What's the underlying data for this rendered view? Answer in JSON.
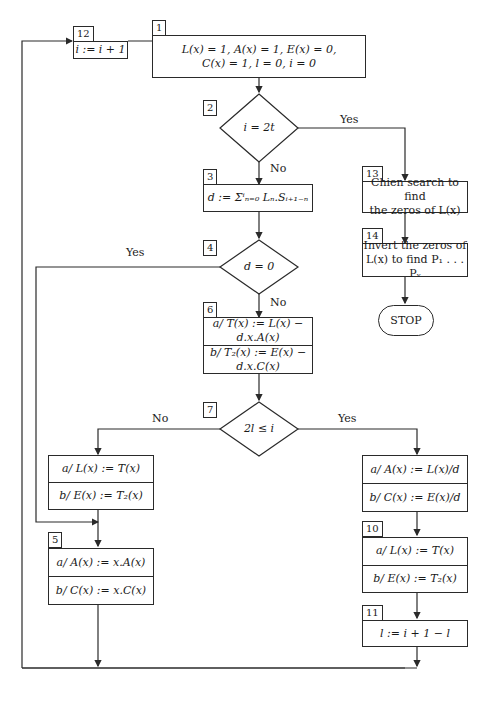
{
  "flowchart": {
    "nodes": {
      "n1": {
        "id": "1",
        "lines": [
          "L(x) = 1,  A(x) = 1,  E(x) = 0,",
          "C(x) = 1,  l = 0,  i = 0"
        ]
      },
      "n2": {
        "id": "2",
        "condition": "i = 2t"
      },
      "n3": {
        "id": "3",
        "text": "d := Σⁱₙ₌₀ Lₙ.Sᵢ₊₁₋ₙ"
      },
      "n4": {
        "id": "4",
        "condition": "d = 0"
      },
      "n5": {
        "id": "5",
        "a": "a/ A(x) := x.A(x)",
        "b": "b/ C(x) := x.C(x)"
      },
      "n6": {
        "id": "6",
        "a": "a/ T(x) := L(x) − d.x.A(x)",
        "b": "b/ T₂(x) := E(x) − d.x.C(x)"
      },
      "n7": {
        "id": "7",
        "condition": "2l ≤ i"
      },
      "n8": {
        "id": "8",
        "a": "a/ L(x) := T(x)",
        "b": "b/ E(x) := T₂(x)"
      },
      "n9": {
        "id": "9",
        "a": "a/ A(x) := L(x)/d",
        "b": "b/ C(x) := E(x)/d"
      },
      "n10": {
        "id": "10",
        "a": "a/ L(x) := T(x)",
        "b": "b/ E(x) := T₂(x)"
      },
      "n11": {
        "id": "11",
        "text": "l := i + 1 − l"
      },
      "n12": {
        "id": "12",
        "text": "i := i + 1"
      },
      "n13": {
        "id": "13",
        "lines": [
          "Chien search to find",
          "the zeros of L(x)"
        ]
      },
      "n14": {
        "id": "14",
        "lines": [
          "Invert the zeros of",
          "L(x) to find P₁ . . . Pᵥ"
        ]
      },
      "stop": {
        "text": "STOP"
      }
    },
    "edge_labels": {
      "n2_yes": "Yes",
      "n2_no": "No",
      "n4_yes": "Yes",
      "n4_no": "No",
      "n7_no": "No",
      "n7_yes": "Yes"
    }
  }
}
